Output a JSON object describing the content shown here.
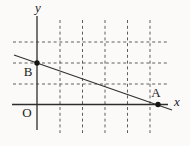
{
  "figure": {
    "type": "coordinate-plane-diagram",
    "description_visible_elements": "line through point B on y-axis and point A on x-axis over a dashed grid",
    "labels": {
      "y_axis": "y",
      "x_axis": "x",
      "origin": "O",
      "point_b": "B",
      "point_a": "A"
    },
    "colors": {
      "paper": "#fbfaf8",
      "axis": "#2e2d2b",
      "line": "#34322f",
      "grid_dash": "#5f5e5a",
      "point": "#171513",
      "text": "#23211e"
    }
  }
}
